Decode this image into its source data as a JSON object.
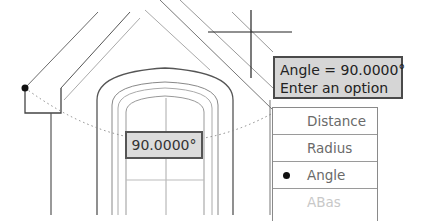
{
  "drawing": {
    "subject": "house gable with arched window (CAD elevation)",
    "crosshair": {
      "x": 251,
      "y": 32
    },
    "grip_point": {
      "x": 25,
      "y": 88
    }
  },
  "tooltip": {
    "line1": "Angle = 90.0000°",
    "line2": "Enter an option"
  },
  "dynamic_input": {
    "value": "90.0000°"
  },
  "options_menu": {
    "items": [
      {
        "label": "Distance",
        "selected": false
      },
      {
        "label": "Radius",
        "selected": false
      },
      {
        "label": "Angle",
        "selected": true
      },
      {
        "label": "ABas",
        "selected": false,
        "partially_visible": true
      }
    ]
  },
  "colors": {
    "tooltip_bg": "#d6d6d6",
    "input_bg": "#dcdcdc",
    "menu_text": "#6a6a6a",
    "line": "#555555"
  }
}
